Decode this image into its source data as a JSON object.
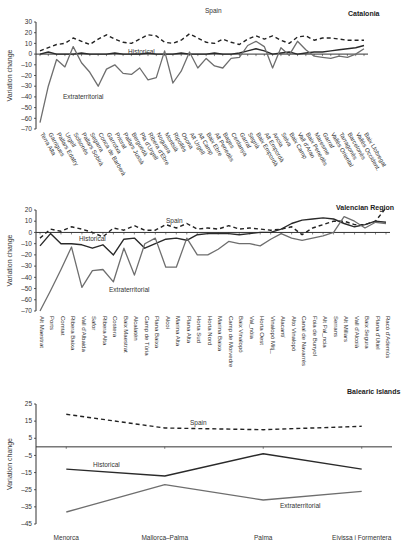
{
  "chart_data": [
    {
      "type": "line",
      "title": "Catalonia",
      "xlabel": "",
      "ylabel": "Variation change",
      "ylim": [
        -70,
        30
      ],
      "yticks": [
        30,
        20,
        10,
        0,
        -10,
        -20,
        -30,
        -40,
        -50,
        -60,
        -70
      ],
      "grid": false,
      "categories": [
        "Terra Alta",
        "Garrigues",
        "Pallars Edatry",
        "Urgell",
        "Solsonès",
        "Pallars Sobirà",
        "Segarra",
        "Conca de Barberà",
        "Garrotxa",
        "Priorat",
        "Pallars Jussà",
        "Berguedà",
        "Pla d'Urgell",
        "Ribera d'Ebre",
        "Noguera",
        "Montsià",
        "Ripollès",
        "Osona",
        "Alt Urgell",
        "Alt Camp",
        "Baix Ebre",
        "Alt Penedès",
        "Bages",
        "Cerdanya",
        "Garraf",
        "Segrià",
        "Baix Empordà",
        "Alt Empordà",
        "Anoia",
        "Selva",
        "Baix Camp",
        "Vall d'Aran",
        "Baix Penedès",
        "Maresme",
        "Garraf",
        "Vallès Oriental",
        "Tarragonès",
        "Barcelonès",
        "Vallès Occident.",
        "Baix Llobregat"
      ],
      "series": [
        {
          "name": "Spain",
          "style": "dashed",
          "values": [
            3,
            6,
            9,
            10,
            15,
            12,
            9,
            14,
            18,
            14,
            11,
            10,
            14,
            18,
            17,
            11,
            10,
            13,
            19,
            15,
            11,
            10,
            14,
            11,
            9,
            14,
            17,
            14,
            17,
            13,
            10,
            16,
            17,
            13,
            15,
            15,
            14,
            13,
            13,
            13
          ]
        },
        {
          "name": "Historical",
          "style": "solid",
          "values": [
            0,
            2,
            0,
            0,
            0,
            1,
            0,
            0,
            0,
            1,
            0,
            0,
            0,
            1,
            0,
            0,
            0,
            1,
            0,
            0,
            0,
            1,
            0,
            0,
            1,
            3,
            5,
            3,
            0,
            1,
            2,
            0,
            1,
            2,
            2,
            3,
            4,
            5,
            6,
            8
          ]
        },
        {
          "name": "Extraterritorial",
          "style": "solid-grey",
          "values": [
            -64,
            -30,
            -5,
            -12,
            7,
            -8,
            -17,
            -30,
            -14,
            -10,
            -18,
            -19,
            -13,
            -24,
            -22,
            3,
            -27,
            -16,
            2,
            -13,
            -4,
            -11,
            -13,
            -4,
            -3,
            8,
            12,
            7,
            -13,
            6,
            -1,
            12,
            4,
            -2,
            -3,
            -4,
            -2,
            -3,
            0,
            5
          ]
        }
      ]
    },
    {
      "type": "line",
      "title": "Valencian Region",
      "xlabel": "",
      "ylabel": "Variation change",
      "ylim": [
        -70,
        20
      ],
      "yticks": [
        20,
        10,
        0,
        -10,
        -20,
        -30,
        -40,
        -50,
        -60,
        -70
      ],
      "grid": false,
      "categories": [
        "Alt Maestrat",
        "Ports",
        "Comtat",
        "Ribera Baixa",
        "Vall d'Albaida",
        "Safor",
        "Ribera Alta",
        "Costera",
        "Baix Maestrat",
        "Alcalatén",
        "Camp de Túria",
        "Plana Baixa",
        "Alcoi",
        "Marina Alta",
        "Plana Alta",
        "Horta Sud",
        "Horta Nord",
        "Marina Baixa",
        "Camp de Morvedre",
        "Baix Vinalopó",
        "Val_nòia",
        "Horta Oest",
        "Vinalopó Mitj_",
        "Alacantí",
        "Alto Vinalopó",
        "Canal de Navarrés",
        "Foia de Bunyol",
        "Alt Pal_ncia",
        "Serrans",
        "Alt Millars",
        "Vall d'Alcoià",
        "Baix Segura",
        "Plana d'Utiel",
        "Racó d'Ademús"
      ],
      "series": [
        {
          "name": "Spain",
          "style": "dashed",
          "values": [
            -5,
            3,
            1,
            5,
            3,
            0,
            -4,
            4,
            2,
            6,
            2,
            2,
            7,
            4,
            8,
            3,
            4,
            3,
            6,
            3,
            4,
            3,
            2,
            3,
            5,
            -2,
            4,
            7,
            10,
            10,
            7,
            7,
            10,
            22
          ]
        },
        {
          "name": "Historical",
          "style": "solid",
          "values": [
            -12,
            -1,
            -10,
            -10,
            -11,
            -14,
            -11,
            -20,
            -6,
            -5,
            -14,
            -10,
            -6,
            -5,
            -7,
            -2,
            -1,
            -1,
            -1,
            -2,
            -1,
            0,
            0,
            3,
            8,
            11,
            12,
            13,
            12,
            8,
            5,
            7,
            10,
            9
          ]
        },
        {
          "name": "Extraterritorial",
          "style": "solid-grey",
          "values": [
            -70,
            -52,
            -33,
            -13,
            -49,
            -34,
            -33,
            -44,
            -14,
            -38,
            -10,
            -5,
            -31,
            -31,
            -5,
            -20,
            -20,
            -15,
            -8,
            -10,
            -10,
            -12,
            -6,
            -1,
            -5,
            -7,
            -5,
            -3,
            0,
            14,
            10,
            4,
            9,
            8
          ]
        }
      ]
    },
    {
      "type": "line",
      "title": "Balearic Islands",
      "xlabel": "",
      "ylabel": "Variation change",
      "ylim": [
        -45,
        25
      ],
      "yticks": [
        25,
        15,
        5,
        -5,
        -15,
        -25,
        -35,
        -45
      ],
      "grid": false,
      "categories": [
        "Menorca",
        "Mallorca–Palma",
        "Palma",
        "Eivissa i Formentera"
      ],
      "series": [
        {
          "name": "Spain",
          "style": "dashed",
          "values": [
            19,
            11,
            10,
            12
          ]
        },
        {
          "name": "Historical",
          "style": "solid",
          "values": [
            -13,
            -17,
            -4,
            -13
          ]
        },
        {
          "name": "Extraterritorial",
          "style": "solid-grey",
          "values": [
            -38,
            -22,
            -31,
            -26
          ]
        }
      ]
    }
  ],
  "colors": {
    "spain": "#222222",
    "historical": "#2a2a2a",
    "extraterritorial": "#6e6e6e",
    "axis": "#333333"
  }
}
